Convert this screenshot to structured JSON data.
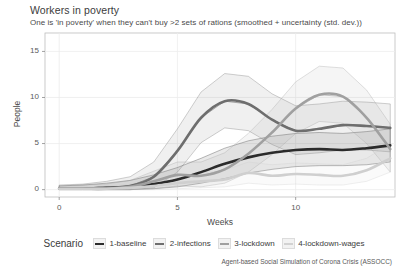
{
  "chart_data": {
    "type": "line",
    "title": "Workers in poverty",
    "subtitle": "One is 'in poverty' when they can't buy >2 sets of rations (smoothed + uncertainty (std. dev.))",
    "xlabel": "Weeks",
    "ylabel": "People",
    "xlim": [
      -0.6,
      14.2
    ],
    "ylim": [
      -0.8,
      17.0
    ],
    "xticks": [
      0,
      5,
      10
    ],
    "yticks": [
      0,
      5,
      10,
      15
    ],
    "grid": true,
    "legend_position": "bottom",
    "legend_title": "Scenario",
    "x": [
      0,
      1,
      2,
      3,
      4,
      5,
      6,
      7,
      8,
      9,
      10,
      11,
      12,
      13,
      14
    ],
    "series": [
      {
        "name": "1-baseline",
        "color": "#2b2b2b",
        "values": [
          0.1,
          0.1,
          0.2,
          0.3,
          0.6,
          1.1,
          1.9,
          2.8,
          3.5,
          4.0,
          4.3,
          4.4,
          4.3,
          4.5,
          4.8
        ],
        "band_upper": [
          0.4,
          0.5,
          0.7,
          1.0,
          1.6,
          2.4,
          3.4,
          4.5,
          5.3,
          5.8,
          6.1,
          6.2,
          6.1,
          6.3,
          6.6
        ],
        "band_lower": [
          0.0,
          0.0,
          0.0,
          0.0,
          0.1,
          0.3,
          0.7,
          1.2,
          1.8,
          2.2,
          2.5,
          2.6,
          2.6,
          2.7,
          3.0
        ]
      },
      {
        "name": "2-infections",
        "color": "#6e6e6e",
        "values": [
          0.1,
          0.1,
          0.2,
          0.4,
          1.4,
          4.2,
          7.8,
          9.6,
          9.3,
          7.6,
          6.4,
          6.6,
          7.0,
          6.9,
          6.7
        ],
        "band_upper": [
          0.5,
          0.6,
          0.9,
          1.4,
          3.0,
          6.6,
          10.6,
          12.6,
          12.3,
          10.4,
          9.1,
          9.3,
          9.6,
          9.5,
          9.3
        ],
        "band_lower": [
          0.0,
          0.0,
          0.0,
          0.0,
          0.2,
          1.9,
          5.1,
          6.7,
          6.4,
          4.9,
          3.8,
          4.0,
          4.3,
          4.3,
          4.1
        ]
      },
      {
        "name": "3-lockdown",
        "color": "#a0a0a0",
        "values": [
          0.1,
          0.1,
          0.1,
          0.3,
          0.9,
          1.6,
          1.5,
          2.2,
          3.9,
          6.2,
          8.8,
          10.3,
          10.1,
          7.8,
          4.4
        ],
        "band_upper": [
          0.4,
          0.5,
          0.6,
          1.0,
          2.0,
          3.0,
          3.0,
          4.0,
          6.1,
          8.7,
          11.7,
          13.4,
          13.2,
          10.8,
          7.1
        ],
        "band_lower": [
          0.0,
          0.0,
          0.0,
          0.0,
          0.1,
          0.4,
          0.3,
          0.7,
          1.9,
          3.8,
          6.1,
          7.4,
          7.2,
          5.0,
          1.9
        ]
      },
      {
        "name": "4-lockdown-wages",
        "color": "#cfcfcf",
        "values": [
          0.1,
          0.1,
          0.1,
          0.2,
          0.4,
          0.7,
          0.9,
          1.1,
          1.8,
          1.5,
          1.7,
          1.6,
          1.5,
          2.1,
          3.4
        ],
        "band_upper": [
          0.3,
          0.3,
          0.4,
          0.6,
          1.0,
          1.5,
          1.8,
          2.1,
          3.0,
          2.7,
          2.9,
          2.8,
          2.7,
          3.4,
          5.0
        ],
        "band_lower": [
          0.0,
          0.0,
          0.0,
          0.0,
          0.0,
          0.1,
          0.2,
          0.3,
          0.7,
          0.5,
          0.6,
          0.5,
          0.5,
          0.9,
          1.9
        ]
      }
    ],
    "credit": "Agent-based Social Simulation of Corona Crisis (ASSOCC)"
  },
  "legend": {
    "title": "Scenario",
    "items": [
      {
        "label": "1-baseline",
        "color": "#2b2b2b"
      },
      {
        "label": "2-infections",
        "color": "#6e6e6e"
      },
      {
        "label": "3-lockdown",
        "color": "#a0a0a0"
      },
      {
        "label": "4-lockdown-wages",
        "color": "#d2d2d2"
      }
    ]
  },
  "axes": {
    "ytick_labels": [
      "15",
      "10",
      "5",
      "0"
    ],
    "xtick_labels": [
      "0",
      "5",
      "10"
    ]
  }
}
